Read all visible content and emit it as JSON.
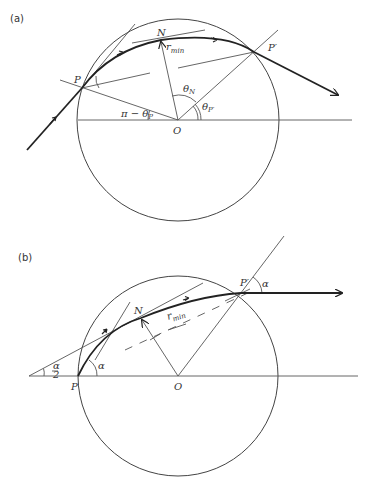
{
  "figure": {
    "panel_a": {
      "tag": "(a)",
      "points": {
        "P": "P",
        "N": "N",
        "P_prime": "P′",
        "O": "O"
      },
      "labels": {
        "r_min": "r",
        "r_min_sub": "min",
        "pi_minus_theta_p": "π − θ",
        "pi_minus_theta_p_sub": "P",
        "theta_n": "θ",
        "theta_n_sub": "N",
        "theta_p_prime": "θ",
        "theta_p_prime_sub": "P′"
      }
    },
    "panel_b": {
      "tag": "(b)",
      "points": {
        "P": "P",
        "N": "N",
        "P_prime": "P′",
        "O": "O"
      },
      "labels": {
        "r_min": "r",
        "r_min_sub": "min",
        "alpha_half_num": "α",
        "alpha_half_den": "2",
        "alpha_at_p": "α",
        "alpha_at_p_prime": "α"
      }
    }
  }
}
